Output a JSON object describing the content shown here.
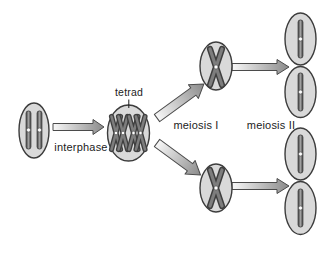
{
  "labels": {
    "tetrad": "tetrad",
    "interphase": "interphase",
    "meiosis1": "meiosis I",
    "meiosis2": "meiosis II"
  },
  "cells": {
    "parent_cells": 1,
    "tetrad_cells": 1,
    "meiosis1_product_cells": 2,
    "meiosis2_product_cells": 4,
    "tetrads_per_cell": 2,
    "chromosomes_in_parent_cell": 2,
    "chromosomes_per_gamete": 1
  },
  "colors": {
    "background": "#ffffff",
    "text": "#1c1c1c",
    "cell_fill": "#d9d9d9",
    "cell_outline": "#3c3c3c",
    "chromosome_dark": "#3f3f3f",
    "chromosome_mid": "#a0a0a0",
    "chromosome_light": "#7d7d7d",
    "centromere": "#ffffff",
    "arrow_start": "#f8f8f8",
    "arrow_end": "#8a8a8a",
    "arrow_outline": "#4b4b4b"
  }
}
